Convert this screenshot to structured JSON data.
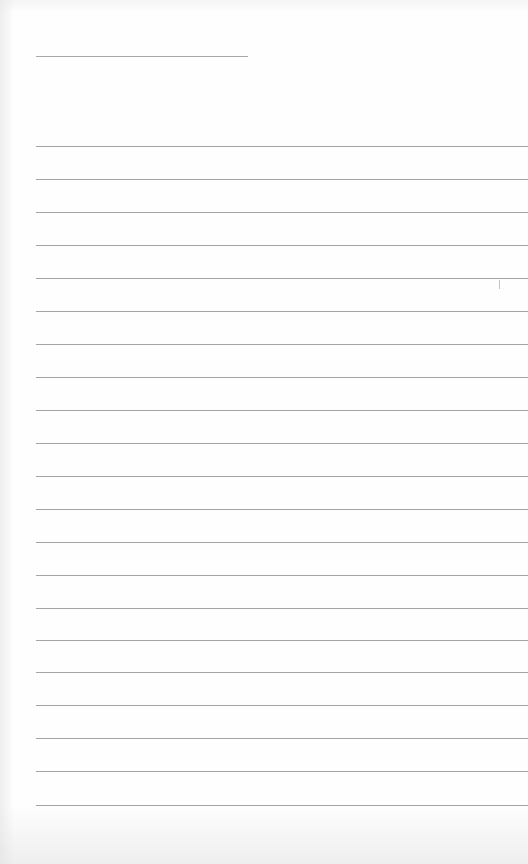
{
  "notepad": {
    "title": {
      "value": "",
      "line": {
        "x": 36,
        "y": 56,
        "width": 212
      }
    },
    "rule_color": "#a4a4a4",
    "line_start_x": 36,
    "line_spacing": 33,
    "lines": [
      {
        "y": 146,
        "text": ""
      },
      {
        "y": 179,
        "text": ""
      },
      {
        "y": 212,
        "text": ""
      },
      {
        "y": 245,
        "text": ""
      },
      {
        "y": 278,
        "text": ""
      },
      {
        "y": 311,
        "text": ""
      },
      {
        "y": 344,
        "text": ""
      },
      {
        "y": 377,
        "text": ""
      },
      {
        "y": 410,
        "text": ""
      },
      {
        "y": 443,
        "text": ""
      },
      {
        "y": 476,
        "text": ""
      },
      {
        "y": 509,
        "text": ""
      },
      {
        "y": 542,
        "text": ""
      },
      {
        "y": 575,
        "text": ""
      },
      {
        "y": 608,
        "text": ""
      },
      {
        "y": 640,
        "text": ""
      },
      {
        "y": 672,
        "text": ""
      },
      {
        "y": 705,
        "text": ""
      },
      {
        "y": 738,
        "text": ""
      },
      {
        "y": 771,
        "text": ""
      },
      {
        "y": 805,
        "text": ""
      }
    ],
    "caret": {
      "x": 499,
      "y": 280
    }
  }
}
